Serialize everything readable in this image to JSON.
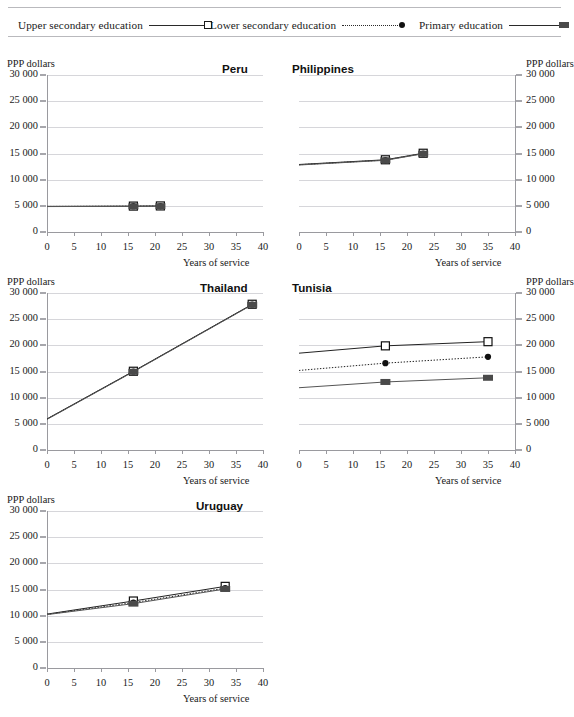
{
  "legend": {
    "items": [
      {
        "label": "Upper secondary education",
        "marker": "open-square-icon",
        "line": "solid",
        "color": "#2a2a2a"
      },
      {
        "label": "Lower secondary education",
        "marker": "filled-circle-icon",
        "line": "dotted",
        "color": "#2a2a2a"
      },
      {
        "label": "Primary education",
        "marker": "filled-square-icon",
        "line": "solid",
        "color": "#4a4a4a"
      }
    ]
  },
  "axis": {
    "ylabel": "PPP dollars",
    "xlabel": "Years of service",
    "yticks": [
      "0",
      "5 000",
      "10 000",
      "15 000",
      "20 000",
      "25 000",
      "30 000"
    ],
    "xticks": [
      "0",
      "5",
      "10",
      "15",
      "20",
      "25",
      "30",
      "35",
      "40"
    ]
  },
  "chart_data": {
    "type": "line",
    "xlabel": "Years of service",
    "ylabel": "PPP dollars",
    "xlim": [
      0,
      40
    ],
    "ylim": [
      0,
      30000
    ],
    "yticks": [
      0,
      5000,
      10000,
      15000,
      20000,
      25000,
      30000
    ],
    "xticks": [
      0,
      5,
      10,
      15,
      20,
      25,
      30,
      35,
      40
    ],
    "grid": "horizontal",
    "legend_position": "top",
    "panels": [
      {
        "name": "Peru",
        "axis_side": "left",
        "series": [
          {
            "name": "Upper secondary education",
            "marker": "open-square",
            "line": "solid",
            "x": [
              0,
              16,
              21
            ],
            "y": [
              4900,
              4950,
              4980
            ]
          },
          {
            "name": "Lower secondary education",
            "marker": "filled-circle",
            "line": "dotted",
            "x": [
              0,
              16,
              21
            ],
            "y": [
              4880,
              4930,
              4960
            ]
          },
          {
            "name": "Primary education",
            "marker": "filled-square",
            "line": "solid",
            "x": [
              0,
              16,
              21
            ],
            "y": [
              4860,
              4900,
              4930
            ]
          }
        ]
      },
      {
        "name": "Philippines",
        "axis_side": "right",
        "series": [
          {
            "name": "Upper secondary education",
            "marker": "open-square",
            "line": "solid",
            "x": [
              0,
              16,
              23
            ],
            "y": [
              12900,
              13800,
              15050
            ]
          },
          {
            "name": "Lower secondary education",
            "marker": "filled-circle",
            "line": "dotted",
            "x": [
              0,
              16,
              23
            ],
            "y": [
              12850,
              13750,
              15000
            ]
          },
          {
            "name": "Primary education",
            "marker": "filled-square",
            "line": "solid",
            "x": [
              0,
              16,
              23
            ],
            "y": [
              12800,
              13700,
              14950
            ]
          }
        ]
      },
      {
        "name": "Thailand",
        "axis_side": "left",
        "series": [
          {
            "name": "Upper secondary education",
            "marker": "open-square",
            "line": "solid",
            "x": [
              0,
              16,
              38
            ],
            "y": [
              5950,
              15050,
              27850
            ]
          },
          {
            "name": "Lower secondary education",
            "marker": "filled-circle",
            "line": "dotted",
            "x": [
              0,
              16,
              38
            ],
            "y": [
              5900,
              15000,
              27800
            ]
          },
          {
            "name": "Primary education",
            "marker": "filled-square",
            "line": "solid",
            "x": [
              0,
              16,
              38
            ],
            "y": [
              5850,
              14950,
              27750
            ]
          }
        ]
      },
      {
        "name": "Tunisia",
        "axis_side": "right",
        "series": [
          {
            "name": "Upper secondary education",
            "marker": "open-square",
            "line": "solid",
            "x": [
              0,
              16,
              35
            ],
            "y": [
              18500,
              19900,
              20700
            ]
          },
          {
            "name": "Lower secondary education",
            "marker": "filled-circle",
            "line": "dotted",
            "x": [
              0,
              16,
              35
            ],
            "y": [
              15200,
              16600,
              17800
            ]
          },
          {
            "name": "Primary education",
            "marker": "filled-square",
            "line": "solid",
            "x": [
              0,
              16,
              35
            ],
            "y": [
              11900,
              13000,
              13800
            ]
          }
        ]
      },
      {
        "name": "Uruguay",
        "axis_side": "left",
        "series": [
          {
            "name": "Upper secondary education",
            "marker": "open-square",
            "line": "solid",
            "x": [
              0,
              16,
              33
            ],
            "y": [
              10300,
              12800,
              15600
            ]
          },
          {
            "name": "Lower secondary education",
            "marker": "filled-circle",
            "line": "dotted",
            "x": [
              0,
              16,
              33
            ],
            "y": [
              10250,
              12500,
              15250
            ]
          },
          {
            "name": "Primary education",
            "marker": "filled-square",
            "line": "solid",
            "x": [
              0,
              16,
              33
            ],
            "y": [
              10200,
              12300,
              15100
            ]
          }
        ]
      }
    ]
  }
}
